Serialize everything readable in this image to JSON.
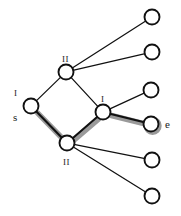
{
  "figure": {
    "type": "node-link-graph",
    "background_color": "#ffffff",
    "node_fill_color": "#ffffff",
    "node_stroke_color": "#111111",
    "edge_color": "#111111",
    "highlight_color": "#9a9a9a"
  },
  "nodes": [
    {
      "id": "n_upper",
      "label": "II",
      "label_position": "above",
      "x": 66,
      "y": 72,
      "r": 7.5,
      "kind": "internal"
    },
    {
      "id": "n_left",
      "label": "I",
      "label_position": "above-left",
      "x": 31,
      "y": 106,
      "r": 7.5,
      "kind": "internal"
    },
    {
      "id": "n_right",
      "label": "I",
      "label_position": "above",
      "x": 103,
      "y": 112,
      "r": 7.5,
      "kind": "internal"
    },
    {
      "id": "n_bottom",
      "label": "II",
      "label_position": "below",
      "x": 67,
      "y": 143,
      "r": 7.5,
      "kind": "internal"
    },
    {
      "id": "leaf_1",
      "label": "",
      "x": 152,
      "y": 17,
      "r": 7.5,
      "kind": "leaf"
    },
    {
      "id": "leaf_2",
      "label": "",
      "x": 152,
      "y": 52,
      "r": 7.5,
      "kind": "leaf"
    },
    {
      "id": "leaf_3",
      "label": "",
      "x": 151,
      "y": 90,
      "r": 7.5,
      "kind": "leaf"
    },
    {
      "id": "leaf_e",
      "label": "",
      "x": 151,
      "y": 124,
      "r": 7.5,
      "kind": "leaf"
    },
    {
      "id": "leaf_5",
      "label": "",
      "x": 152,
      "y": 160,
      "r": 7.5,
      "kind": "leaf"
    },
    {
      "id": "leaf_6",
      "label": "",
      "x": 152,
      "y": 196,
      "r": 7.5,
      "kind": "leaf"
    }
  ],
  "edges": [
    {
      "from": "n_left",
      "to": "n_upper",
      "highlighted": false
    },
    {
      "from": "n_upper",
      "to": "n_right",
      "highlighted": false
    },
    {
      "from": "n_left",
      "to": "n_bottom",
      "highlighted": true
    },
    {
      "from": "n_bottom",
      "to": "n_right",
      "highlighted": true
    },
    {
      "from": "n_right",
      "to": "leaf_e",
      "highlighted": true
    },
    {
      "from": "n_upper",
      "to": "leaf_1",
      "highlighted": false
    },
    {
      "from": "n_upper",
      "to": "leaf_2",
      "highlighted": false
    },
    {
      "from": "n_right",
      "to": "leaf_3",
      "highlighted": false
    },
    {
      "from": "n_bottom",
      "to": "leaf_5",
      "highlighted": false
    },
    {
      "from": "n_bottom",
      "to": "leaf_6",
      "highlighted": false
    }
  ],
  "annotations": {
    "source_label": "s",
    "source_marker": "I",
    "end_label": "e",
    "upper_label": "II",
    "right_label": "I",
    "bottom_label": "II"
  }
}
